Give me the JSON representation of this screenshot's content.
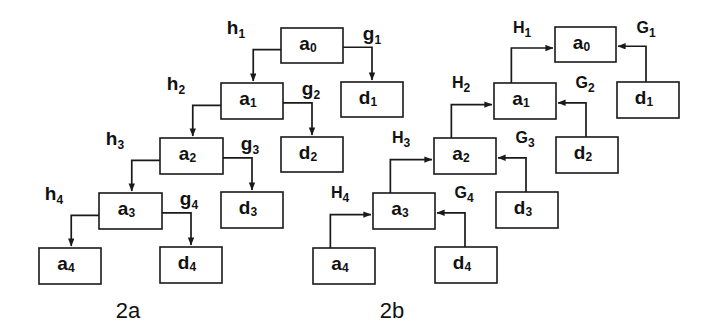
{
  "figure": {
    "title": "",
    "background_color": "#ffffff",
    "stroke_color": "#1a1a1a",
    "width": 716,
    "height": 336
  },
  "panels": [
    {
      "id": "2a",
      "caption": "2a",
      "caption_x": 128,
      "caption_y": 318,
      "description": "Forward cascade: arrows flow downward from a0 through a1..a4 and outward to d1..d4",
      "nodes": [
        {
          "name": "a0",
          "base": "a",
          "sub": "0",
          "x": 281,
          "y": 28,
          "w": 62,
          "h": 35
        },
        {
          "name": "d1",
          "base": "d",
          "sub": "1",
          "x": 341,
          "y": 82,
          "w": 62,
          "h": 35
        },
        {
          "name": "a1",
          "base": "a",
          "sub": "1",
          "x": 221,
          "y": 83,
          "w": 62,
          "h": 36
        },
        {
          "name": "d2",
          "base": "d",
          "sub": "2",
          "x": 281,
          "y": 137,
          "w": 62,
          "h": 35
        },
        {
          "name": "a2",
          "base": "a",
          "sub": "2",
          "x": 160,
          "y": 138,
          "w": 63,
          "h": 36
        },
        {
          "name": "d3",
          "base": "d",
          "sub": "3",
          "x": 221,
          "y": 192,
          "w": 62,
          "h": 36
        },
        {
          "name": "a3",
          "base": "a",
          "sub": "3",
          "x": 99,
          "y": 193,
          "w": 63,
          "h": 36
        },
        {
          "name": "d4",
          "base": "d",
          "sub": "4",
          "x": 160,
          "y": 247,
          "w": 62,
          "h": 36
        },
        {
          "name": "a4",
          "base": "a",
          "sub": "4",
          "x": 39,
          "y": 248,
          "w": 62,
          "h": 36
        }
      ],
      "edges": [
        {
          "name": "h1",
          "base": "h",
          "sub": "1",
          "label_x": 236,
          "label_y": 34,
          "from": "a0",
          "to": "a1",
          "kind": "h"
        },
        {
          "name": "g1",
          "base": "g",
          "sub": "1",
          "label_x": 372,
          "label_y": 40,
          "from": "a0",
          "to": "d1",
          "kind": "g"
        },
        {
          "name": "h2",
          "base": "h",
          "sub": "2",
          "label_x": 176,
          "label_y": 90,
          "from": "a1",
          "to": "a2",
          "kind": "h"
        },
        {
          "name": "g2",
          "base": "g",
          "sub": "2",
          "label_x": 311,
          "label_y": 95,
          "from": "a1",
          "to": "d2",
          "kind": "g"
        },
        {
          "name": "h3",
          "base": "h",
          "sub": "3",
          "label_x": 115,
          "label_y": 145,
          "from": "a2",
          "to": "a3",
          "kind": "h"
        },
        {
          "name": "g3",
          "base": "g",
          "sub": "3",
          "label_x": 250,
          "label_y": 150,
          "from": "a2",
          "to": "d3",
          "kind": "g"
        },
        {
          "name": "h4",
          "base": "h",
          "sub": "4",
          "label_x": 54,
          "label_y": 200,
          "from": "a3",
          "to": "a4",
          "kind": "h"
        },
        {
          "name": "g4",
          "base": "g",
          "sub": "4",
          "label_x": 189,
          "label_y": 205,
          "from": "a3",
          "to": "d4",
          "kind": "g"
        }
      ]
    },
    {
      "id": "2b",
      "caption": "2b",
      "caption_x": 392,
      "caption_y": 318,
      "description": "Reverse cascade: arrows flow upward from a4 into a3..a0 and from d1..d4 back into the a chain",
      "nodes": [
        {
          "name": "a0",
          "base": "a",
          "sub": "0",
          "x": 555,
          "y": 27,
          "w": 61,
          "h": 35
        },
        {
          "name": "d1",
          "base": "d",
          "sub": "1",
          "x": 617,
          "y": 82,
          "w": 62,
          "h": 36
        },
        {
          "name": "a1",
          "base": "a",
          "sub": "1",
          "x": 494,
          "y": 83,
          "w": 62,
          "h": 36
        },
        {
          "name": "d2",
          "base": "d",
          "sub": "2",
          "x": 556,
          "y": 137,
          "w": 62,
          "h": 36
        },
        {
          "name": "a2",
          "base": "a",
          "sub": "2",
          "x": 434,
          "y": 138,
          "w": 62,
          "h": 36
        },
        {
          "name": "d3",
          "base": "d",
          "sub": "3",
          "x": 496,
          "y": 192,
          "w": 62,
          "h": 36
        },
        {
          "name": "a3",
          "base": "a",
          "sub": "3",
          "x": 373,
          "y": 193,
          "w": 62,
          "h": 36
        },
        {
          "name": "d4",
          "base": "d",
          "sub": "4",
          "x": 435,
          "y": 247,
          "w": 62,
          "h": 36
        },
        {
          "name": "a4",
          "base": "a",
          "sub": "4",
          "x": 313,
          "y": 248,
          "w": 62,
          "h": 36
        }
      ],
      "edges": [
        {
          "name": "H1",
          "base": "H",
          "sub": "1",
          "label_x": 522,
          "label_y": 33,
          "from": "a1",
          "to": "a0",
          "kind": "H"
        },
        {
          "name": "G1",
          "base": "G",
          "sub": "1",
          "label_x": 646,
          "label_y": 33,
          "from": "d1",
          "to": "a0",
          "kind": "G"
        },
        {
          "name": "H2",
          "base": "H",
          "sub": "2",
          "label_x": 461,
          "label_y": 88,
          "from": "a2",
          "to": "a1",
          "kind": "H"
        },
        {
          "name": "G2",
          "base": "G",
          "sub": "2",
          "label_x": 585,
          "label_y": 88,
          "from": "d2",
          "to": "a1",
          "kind": "G"
        },
        {
          "name": "H3",
          "base": "H",
          "sub": "3",
          "label_x": 401,
          "label_y": 143,
          "from": "a3",
          "to": "a2",
          "kind": "H"
        },
        {
          "name": "G3",
          "base": "G",
          "sub": "3",
          "label_x": 525,
          "label_y": 143,
          "from": "d3",
          "to": "a2",
          "kind": "G"
        },
        {
          "name": "H4",
          "base": "H",
          "sub": "4",
          "label_x": 340,
          "label_y": 198,
          "from": "a4",
          "to": "a3",
          "kind": "H"
        },
        {
          "name": "G4",
          "base": "G",
          "sub": "4",
          "label_x": 464,
          "label_y": 198,
          "from": "d4",
          "to": "a3",
          "kind": "G"
        }
      ]
    }
  ]
}
